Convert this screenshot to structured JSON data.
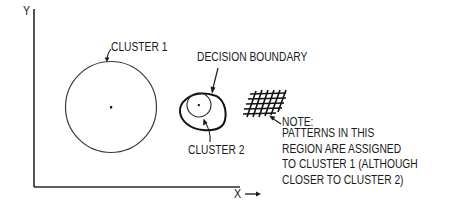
{
  "diagram": {
    "axes": {
      "y_label": "Y",
      "x_label": "X"
    },
    "labels": {
      "cluster1": "CLUSTER 1",
      "cluster2": "CLUSTER 2",
      "decision_boundary": "DECISION BOUNDARY",
      "note_title": "NOTE:",
      "note_lines": [
        "PATTERNS IN THIS",
        "REGION ARE ASSIGNED",
        "TO CLUSTER 1 (ALTHOUGH",
        "CLOSER TO CLUSTER 2)"
      ]
    },
    "elements": {
      "cluster1_circle": "large circle with center dot",
      "cluster2_circle": "small circle with center dot",
      "boundary": "egg-shaped decision boundary enclosing cluster 2",
      "hatched_region": "cross-hatched region outside boundary"
    },
    "colors": {
      "ink": "#1a1a1a",
      "background": "#ffffff"
    }
  }
}
